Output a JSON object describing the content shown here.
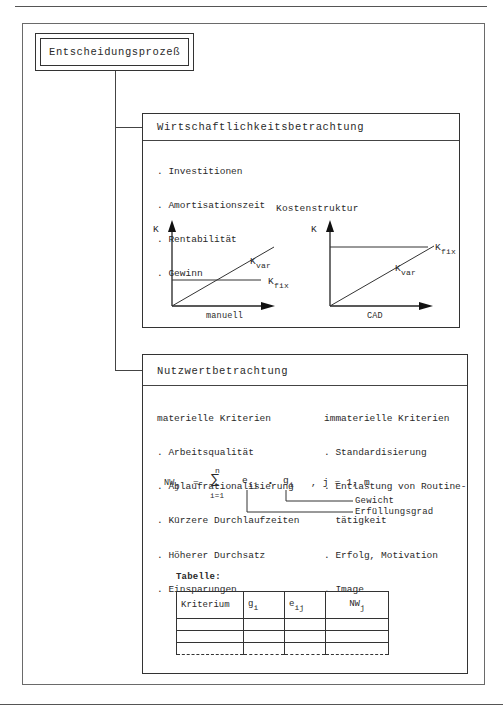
{
  "diagram": {
    "root": {
      "label": "Entscheidungsprozeß"
    },
    "economic": {
      "title": "Wirtschaftlichkeitsbetrachtung",
      "items": [
        ". Investitionen",
        ". Amortisationszeit",
        ". Rentabilität",
        ". Gewinn"
      ],
      "cost_structure_title": "Kostenstruktur",
      "charts": [
        {
          "y_label": "K",
          "x_label": "manuell",
          "var_label": "K",
          "var_sub": "var",
          "fix_label": "K",
          "fix_sub": "fix",
          "description": "low fixed cost, steep variable cost"
        },
        {
          "y_label": "K",
          "x_label": "CAD",
          "var_label": "K",
          "var_sub": "var",
          "fix_label": "K",
          "fix_sub": "fix",
          "description": "high fixed cost, flatter variable cost"
        }
      ]
    },
    "utility": {
      "title": "Nutzwertbetrachtung",
      "material": {
        "heading": "materielle Kriterien",
        "items": [
          ". Arbeitsqualität",
          ". Ablaufrationalisierung",
          ". Kürzere Durchlaufzeiten",
          ". Höherer Durchsatz",
          ". Einsparungen"
        ]
      },
      "immaterial": {
        "heading": "immaterielle Kriterien",
        "items": [
          ". Standardisierung",
          ". Entlastung von Routine-",
          "  tätigkeit",
          ". Erfolg, Motivation",
          ". Image"
        ]
      },
      "formula": {
        "lhs": "NW",
        "lhs_sub": "j",
        "eq": "=",
        "sum_top": "n",
        "sum_symbol": "∑",
        "sum_bottom": "i=1",
        "e": "e",
        "e_sub": "ij",
        "dot": "•",
        "g": "g",
        "g_sub": "i",
        "range": ", j = 1, m"
      },
      "annotations": {
        "weight": "Gewicht",
        "fulfillment": "Erfüllungsgrad"
      },
      "table": {
        "caption": "Tabelle:",
        "headers": [
          {
            "text": "Kriterium",
            "sub": ""
          },
          {
            "text": "g",
            "sub": "i"
          },
          {
            "text": "e",
            "sub": "ij"
          },
          {
            "text": "NW",
            "sub": "j"
          }
        ],
        "empty_rows": 3
      }
    }
  }
}
